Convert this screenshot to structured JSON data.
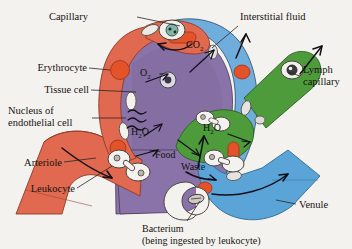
{
  "figure": {
    "background_color": "#f4f2ee"
  },
  "colors": {
    "arteriole": "#e0694f",
    "arteriole_shade": "#c75640",
    "venule": "#5aa4d8",
    "venule_shade": "#4890c6",
    "interstitial_fluid": "#6faedc",
    "tissue_cell": "#8a73a8",
    "tissue_cell_shade": "#7b6597",
    "lymph_capillary": "#4e9b3c",
    "erythrocyte": "#e4522a",
    "leukocyte": "#f2f0ec",
    "nucleus_outline": "#4a4440",
    "label_text": "#161210"
  },
  "labels": {
    "capillary": "Capillary",
    "erythrocyte": "Erythrocyte",
    "tissue_cell": "Tissue cell",
    "nucleus_of_endothelial_cell_line1": "Nucleus of",
    "nucleus_of_endothelial_cell_line2": "endothelial cell",
    "arteriole": "Arteriole",
    "leukocyte": "Leukocyte",
    "interstitial_fluid": "Interstitial fluid",
    "lymph_capillary_line1": "Lymph",
    "lymph_capillary_line2": "capillary",
    "venule": "Venule",
    "bacterium_line1": "Bacterium",
    "bacterium_line2": "(being ingested by leukocyte)"
  },
  "molecules": {
    "oxygen": "O",
    "oxygen_sub": "2",
    "carbon_dioxide": "CO",
    "carbon_dioxide_sub": "2",
    "water_left_main": "H",
    "water_left_sub": "2",
    "water_left_tail": "O",
    "water_right_main": "H",
    "water_right_sub": "2",
    "water_right_tail": "O",
    "food": "Food",
    "waste": "Waste"
  },
  "icons": {
    "endothelial_nucleus": "nucleus-icon",
    "erythrocyte_cell": "erythrocyte-icon",
    "leukocyte_cell": "leukocyte-icon",
    "bacterium_cell": "bacterium-icon",
    "flow_arrow": "flow-arrow-icon",
    "diffusion_arrow": "diffusion-arrow-icon"
  }
}
